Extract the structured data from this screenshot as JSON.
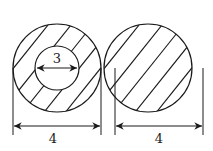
{
  "figure": {
    "left_shape": {
      "description": "hollow tube cross-section",
      "outer_diameter_label": "4",
      "inner_diameter_label": "3"
    },
    "right_shape": {
      "description": "solid rod cross-section",
      "diameter_label": "4"
    }
  },
  "colors": {
    "stroke": "#1a1a1a",
    "background": "#ffffff"
  }
}
